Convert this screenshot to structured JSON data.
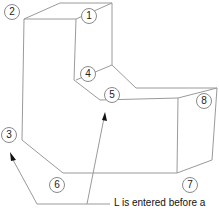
{
  "diagram": {
    "type": "isometric-solid-vertex-labels",
    "stroke_color": "#9a9a9a",
    "vertex_labels": [
      {
        "id": "1",
        "x": 88,
        "y": 16
      },
      {
        "id": "2",
        "x": 11,
        "y": 12
      },
      {
        "id": "3",
        "x": 8,
        "y": 135
      },
      {
        "id": "4",
        "x": 88,
        "y": 73
      },
      {
        "id": "5",
        "x": 112,
        "y": 95
      },
      {
        "id": "6",
        "x": 56,
        "y": 184
      },
      {
        "id": "7",
        "x": 189,
        "y": 184
      },
      {
        "id": "8",
        "x": 204,
        "y": 101
      }
    ],
    "annotation": "L is entered before a"
  }
}
